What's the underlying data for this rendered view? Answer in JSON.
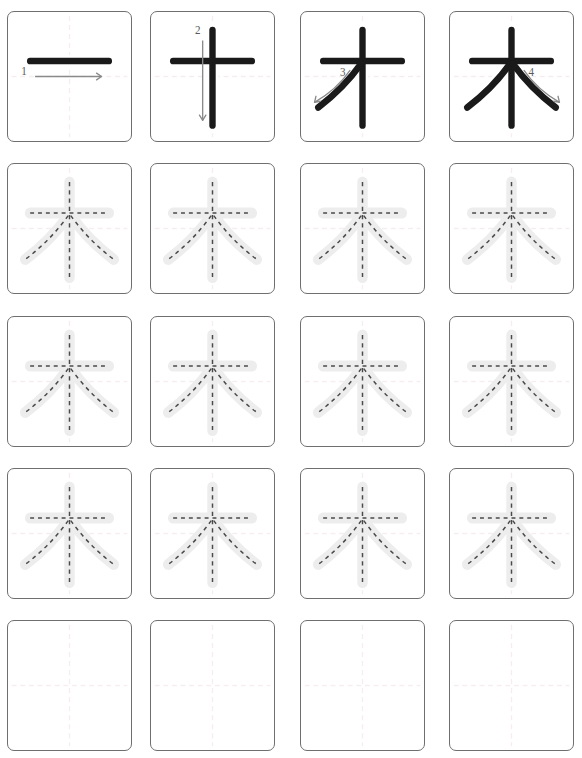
{
  "worksheet": {
    "title": "Chinese character stroke order practice sheet",
    "character": "木",
    "meaning": "tree / wood",
    "total_strokes": 4,
    "rows": 5,
    "columns": 4
  },
  "colors": {
    "cell_border": "#6f6f6f",
    "stroke_black": "#1a1a1a",
    "stroke_halo": "#ffffff",
    "trace_body": "#ededed",
    "trace_dash": "#4a4a4a",
    "arrow": "#8a8a8a",
    "number": "#5a5a5a",
    "guideline": "#f6eeee",
    "background": "#ffffff"
  },
  "stroke_numbers": [
    "1",
    "2",
    "3",
    "4"
  ],
  "stroke_order_row": {
    "label": "stroke-order-demonstration",
    "cells": [
      {
        "index": 0,
        "number": "1",
        "strokes_shown": 1,
        "stroke_name": "heng",
        "description": "horizontal stroke, written left to right"
      },
      {
        "index": 1,
        "number": "2",
        "strokes_shown": 2,
        "stroke_name": "shu",
        "description": "vertical stroke, written top to bottom"
      },
      {
        "index": 2,
        "number": "3",
        "strokes_shown": 3,
        "stroke_name": "pie",
        "description": "left-falling stroke, written down-left"
      },
      {
        "index": 3,
        "number": "4",
        "strokes_shown": 4,
        "stroke_name": "na",
        "description": "right-falling stroke, written down-right"
      }
    ]
  },
  "practice_rows": [
    {
      "index": 1,
      "type": "trace",
      "label": "tracing-row",
      "cells": 4
    },
    {
      "index": 2,
      "type": "trace",
      "label": "tracing-row",
      "cells": 4
    },
    {
      "index": 3,
      "type": "trace",
      "label": "tracing-row",
      "cells": 4
    },
    {
      "index": 4,
      "type": "blank",
      "label": "blank-writing-row",
      "cells": 4
    }
  ],
  "row_tops": [
    11,
    163,
    316,
    468,
    620
  ],
  "geometry": {
    "cell_size": 125,
    "column_lefts": [
      7,
      150,
      300,
      449
    ],
    "guide_center": 50
  }
}
